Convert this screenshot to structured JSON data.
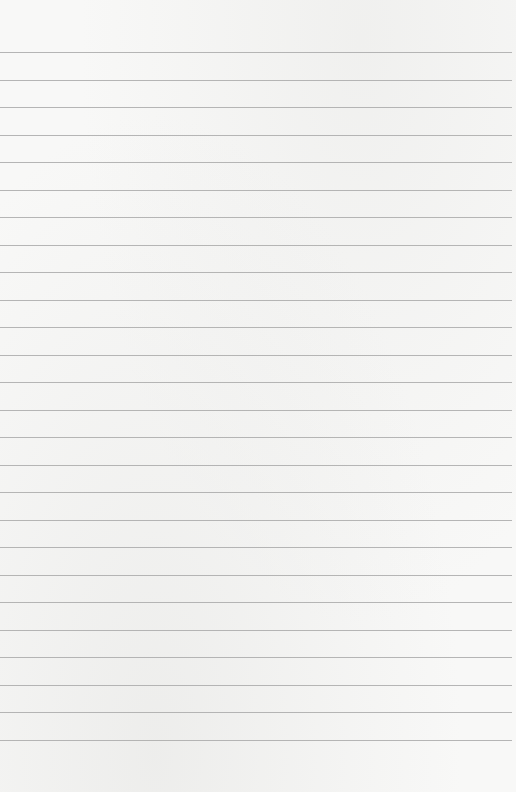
{
  "page": {
    "type": "lined-paper",
    "background_color": "#f8f8f7",
    "line_color": "#a9a9a9",
    "line_count": 26,
    "first_line_y": 52,
    "line_spacing": 27.5,
    "line_width": 512,
    "text": ""
  }
}
